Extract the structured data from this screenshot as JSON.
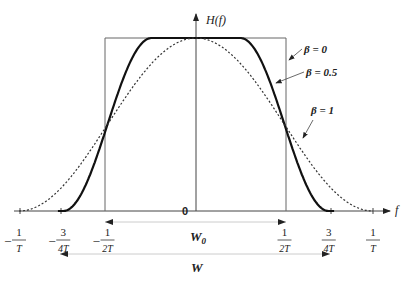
{
  "chart_data": {
    "type": "line",
    "ylabel": "H(f)",
    "xlabel": "f",
    "origin_label": "0",
    "x_ticks": [
      {
        "value": -1.0,
        "num": "1",
        "den": "T",
        "sign": "-"
      },
      {
        "value": -0.75,
        "num": "3",
        "den": "4T",
        "sign": "-"
      },
      {
        "value": -0.5,
        "num": "1",
        "den": "2T",
        "sign": "-"
      },
      {
        "value": 0.5,
        "num": "1",
        "den": "2T",
        "sign": ""
      },
      {
        "value": 0.75,
        "num": "3",
        "den": "4T",
        "sign": ""
      },
      {
        "value": 1.0,
        "num": "1",
        "den": "T",
        "sign": ""
      }
    ],
    "x_unit": "1/T",
    "series": [
      {
        "name": "β = 0",
        "label": "β = 0",
        "beta": 0,
        "style": "solid-thin",
        "description": "ideal rectangular, flat on [-1/2T, 1/2T]"
      },
      {
        "name": "β = 0.5",
        "label": "β = 0.5",
        "beta": 0.5,
        "style": "solid-thick",
        "description": "flat on [-1/4T, 1/4T], zero beyond ±3/4T"
      },
      {
        "name": "β = 1",
        "label": "β = 1",
        "beta": 1,
        "style": "dotted",
        "description": "full cosine, zero at ±1/T"
      }
    ],
    "xlim": [
      -1.05,
      1.1
    ],
    "ylim": [
      0,
      1
    ],
    "annotations": [
      {
        "label": "W0",
        "text": "W",
        "sub": "0",
        "from": -0.5,
        "to": 0.5
      },
      {
        "label": "W",
        "text": "W",
        "sub": "",
        "from": -0.75,
        "to": 0.75
      }
    ]
  },
  "labels": {
    "y_axis": "H(f)",
    "x_axis": "f",
    "origin": "0",
    "beta0": "β = 0",
    "beta05": "β = 0.5",
    "beta1": "β = 1",
    "w0_main": "W",
    "w0_sub": "0",
    "w": "W"
  }
}
